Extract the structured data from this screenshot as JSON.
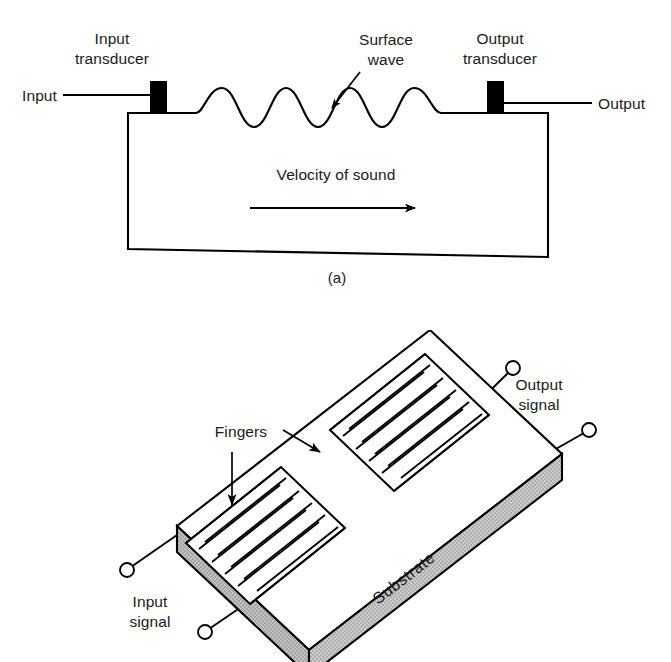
{
  "figure": {
    "panels": [
      {
        "id": "a",
        "caption": "(a)",
        "labels": {
          "input_transducer_line1": "Input",
          "input_transducer_line2": "transducer",
          "output_transducer_line1": "Output",
          "output_transducer_line2": "transducer",
          "surface_wave_line1": "Surface",
          "surface_wave_line2": "wave",
          "input": "Input",
          "output": "Output",
          "velocity": "Velocity of sound"
        }
      },
      {
        "id": "b",
        "caption": "",
        "labels": {
          "fingers": "Fingers",
          "substrate": "Substrate",
          "input_signal_line1": "Input",
          "input_signal_line2": "signal",
          "output_signal_line1": "Output",
          "output_signal_line2": "signal"
        }
      }
    ]
  },
  "colors": {
    "substrate_fill": "#c4c4c4",
    "substrate_side_fill": "#b8b8b8",
    "electrode_black": "#000000",
    "outline": "#000000",
    "background": "#ffffff",
    "text": "#1a1a1a"
  },
  "geometry": {
    "panel_a": {
      "wave_crest_count": 3,
      "substrate_left": 128,
      "substrate_right": 548,
      "substrate_top": 112,
      "substrate_bottom": 257,
      "input_block_x": 150,
      "output_block_x": 487
    },
    "panel_b": {
      "transducer_count": 2,
      "fingers_per_transducer": 9,
      "terminal_count": 4
    }
  }
}
